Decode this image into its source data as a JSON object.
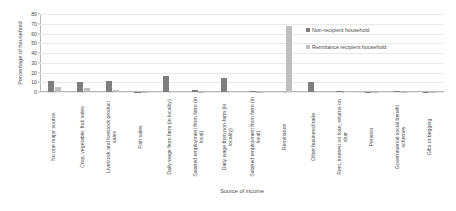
{
  "chart_data": {
    "type": "bar",
    "title": "",
    "xlabel": "Source of income",
    "ylabel": "Percentage of household",
    "ylim": [
      0,
      80
    ],
    "yticks": [
      0,
      10,
      20,
      30,
      40,
      50,
      60,
      70,
      80
    ],
    "grid": true,
    "legend_position": "upper right",
    "categories": [
      "No one major source",
      "Crop, vegetable, fruit sales",
      "Livestock and livestock product sales",
      "Fish sales",
      "Daily wage from farm (in locality)",
      "Salaried employment from farm (in local)",
      "Daily wage from non-farm (in locality)",
      "Salaried employment from farm (in local)",
      "Remittance",
      "Other business/trade",
      "Rent, interest on loan, returns on shar",
      "Pension",
      "Governmental social benefit schemes",
      "Gifts or begging"
    ],
    "series": [
      {
        "name": "Non-recipient household",
        "color": "#7f7f7f",
        "values": [
          11.0,
          10.2,
          11.0,
          0.4,
          16.5,
          1.8,
          14.2,
          1.0,
          0.0,
          9.8,
          1.2,
          0.5,
          0.6,
          0.3
        ]
      },
      {
        "name": "Remittance recipient household",
        "color": "#bfbfbf",
        "values": [
          5.0,
          4.6,
          1.8,
          0.3,
          0.8,
          0.5,
          0.8,
          0.4,
          68.0,
          1.3,
          0.6,
          0.3,
          0.4,
          0.2
        ]
      }
    ]
  },
  "legend": {
    "items": [
      {
        "label": "Non-recipient household"
      },
      {
        "label": "Remittance recipient household"
      }
    ]
  }
}
